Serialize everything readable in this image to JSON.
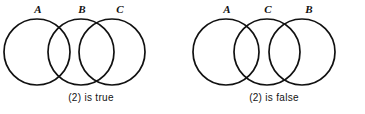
{
  "figure": {
    "background_color": "#ffffff",
    "stroke_color": "#111111",
    "text_color": "#131313",
    "diagrams": [
      {
        "id": "left",
        "caption": "(2) is true",
        "labels": [
          "A",
          "B",
          "C"
        ],
        "circles": [
          {
            "label": "A",
            "cx": 37,
            "cy": 52,
            "r": 33
          },
          {
            "label": "B",
            "cx": 81,
            "cy": 52,
            "r": 33
          },
          {
            "label": "C",
            "cx": 112,
            "cy": 52,
            "r": 33
          }
        ],
        "label_positions": [
          {
            "text": "A",
            "x": 31,
            "y": 4
          },
          {
            "text": "B",
            "x": 75,
            "y": 4
          },
          {
            "text": "C",
            "x": 113,
            "y": 4
          }
        ]
      },
      {
        "id": "right",
        "caption": "(2) is false",
        "labels": [
          "A",
          "C",
          "B"
        ],
        "circles": [
          {
            "label": "A",
            "cx": 43,
            "cy": 52,
            "r": 33
          },
          {
            "label": "C",
            "cx": 84,
            "cy": 52,
            "r": 33
          },
          {
            "label": "B",
            "cx": 119,
            "cy": 52,
            "r": 33
          }
        ],
        "label_positions": [
          {
            "text": "A",
            "x": 37,
            "y": 4
          },
          {
            "text": "C",
            "x": 78,
            "y": 4
          },
          {
            "text": "B",
            "x": 119,
            "y": 4
          }
        ]
      }
    ]
  }
}
